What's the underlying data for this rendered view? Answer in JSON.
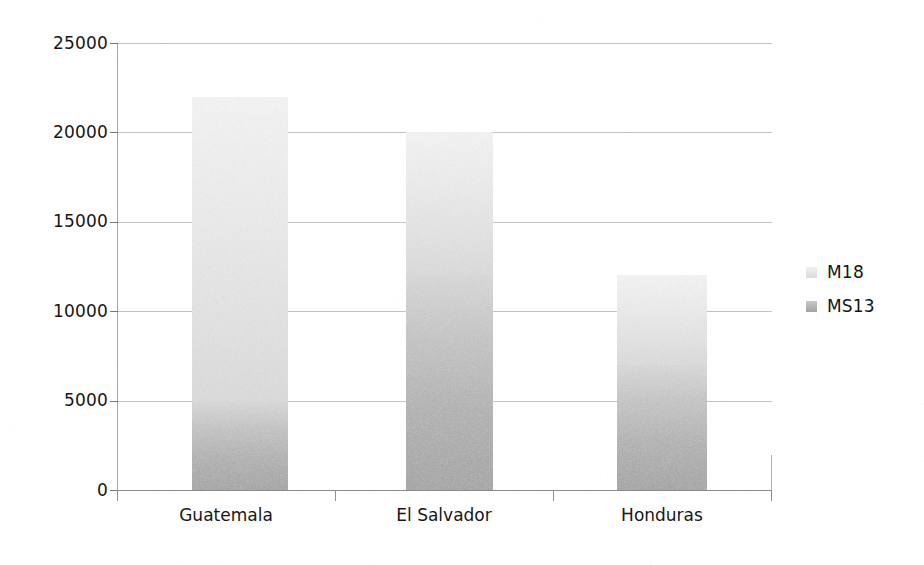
{
  "chart_data": {
    "type": "bar",
    "subtype": "stacked-bar",
    "title": "",
    "subtitle": "",
    "xlabel": "",
    "ylabel": "",
    "categories": [
      "Guatemala",
      "El Salvador",
      "Honduras"
    ],
    "series": [
      {
        "name": "MS13",
        "values": [
          5000,
          12000,
          7000
        ],
        "color": "#b4b4b4",
        "stack_order": 1
      },
      {
        "name": "M18",
        "values": [
          17000,
          8000,
          5000
        ],
        "color": "#e6e6e6",
        "stack_order": 2
      }
    ],
    "totals": [
      22000,
      20000,
      12000
    ],
    "ylim": [
      0,
      25000
    ],
    "yticks": [
      0,
      5000,
      10000,
      15000,
      20000,
      25000
    ],
    "ytick_labels": [
      "0",
      "5000",
      "10000",
      "15000",
      "20000",
      "25000"
    ],
    "grid": true,
    "grid_axis": "y",
    "legend": true,
    "legend_position": "right",
    "legend_entries": [
      "M18",
      "MS13"
    ],
    "annotations": []
  },
  "axes": {
    "y": {
      "ticks": [
        {
          "value": 25000,
          "label": "25000"
        },
        {
          "value": 20000,
          "label": "20000"
        },
        {
          "value": 15000,
          "label": "15000"
        },
        {
          "value": 10000,
          "label": "10000"
        },
        {
          "value": 5000,
          "label": "5000"
        },
        {
          "value": 0,
          "label": "0"
        }
      ]
    },
    "x": {
      "ticks": [
        {
          "label": "Guatemala"
        },
        {
          "label": "El Salvador"
        },
        {
          "label": "Honduras"
        }
      ]
    }
  },
  "legend": {
    "items": [
      {
        "label": "M18",
        "swatch": "m18-swatch"
      },
      {
        "label": "MS13",
        "swatch": "ms13-swatch"
      }
    ]
  },
  "colors": {
    "m18": "#e6e6e6",
    "ms13": "#b4b4b4",
    "gridline": "#b9b9b9",
    "axis": "#8a8a8a",
    "text": "#161616",
    "background": "#ffffff"
  }
}
